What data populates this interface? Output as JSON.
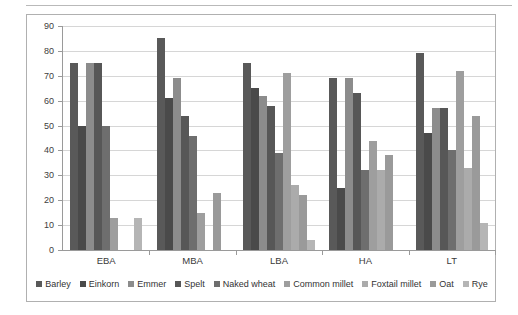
{
  "chart_data": {
    "type": "bar",
    "title": "",
    "xlabel": "",
    "ylabel": "",
    "ylim": [
      0,
      90
    ],
    "y_ticks": [
      0,
      10,
      20,
      30,
      40,
      50,
      60,
      70,
      80,
      90
    ],
    "grid": true,
    "legend_position": "bottom",
    "categories": [
      "EBA",
      "MBA",
      "LBA",
      "HA",
      "LT"
    ],
    "series": [
      {
        "name": "Barley",
        "color": "#595959",
        "values": [
          75,
          85,
          75,
          69,
          79
        ]
      },
      {
        "name": "Einkorn",
        "color": "#4a4a4a",
        "values": [
          50,
          61,
          65,
          25,
          47
        ]
      },
      {
        "name": "Emmer",
        "color": "#8c8c8c",
        "values": [
          75,
          69,
          62,
          69,
          57
        ]
      },
      {
        "name": "Spelt",
        "color": "#575757",
        "values": [
          75,
          54,
          58,
          63,
          57
        ]
      },
      {
        "name": "Naked wheat",
        "color": "#6e6e6e",
        "values": [
          50,
          46,
          39,
          32,
          40
        ]
      },
      {
        "name": "Common millet",
        "color": "#9e9e9e",
        "values": [
          13,
          15,
          71,
          44,
          72
        ]
      },
      {
        "name": "Foxtail millet",
        "color": "#ababab",
        "values": [
          null,
          null,
          26,
          32,
          33
        ]
      },
      {
        "name": "Oat",
        "color": "#9a9a9a",
        "values": [
          null,
          23,
          22,
          38,
          54
        ]
      },
      {
        "name": "Rye",
        "color": "#b5b5b5",
        "values": [
          13,
          null,
          4,
          null,
          11
        ]
      }
    ]
  },
  "legend": {
    "items": [
      "Barley",
      "Einkorn",
      "Emmer",
      "Spelt",
      "Naked wheat",
      "Common millet",
      "Foxtail millet",
      "Oat",
      "Rye"
    ]
  },
  "axis": {
    "y_labels": [
      "90",
      "80",
      "70",
      "60",
      "50",
      "40",
      "30",
      "20",
      "10",
      "0"
    ]
  }
}
